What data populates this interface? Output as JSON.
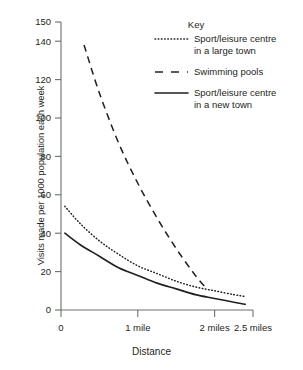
{
  "chart_data": {
    "type": "line",
    "title": "",
    "xlabel": "Distance",
    "ylabel": "Visits made per 1000 population each week",
    "xlim": [
      0,
      2.5
    ],
    "ylim": [
      0,
      150
    ],
    "grid": false,
    "legend_position": "top-right",
    "legend_title": "Key",
    "y_ticks": [
      0,
      20,
      40,
      60,
      80,
      100,
      120,
      140,
      150
    ],
    "y_tick_labels": [
      "0",
      "20",
      "40",
      "60",
      "80",
      "100",
      "120",
      "140",
      "150"
    ],
    "x_ticks": [
      0,
      1,
      2,
      2.5
    ],
    "x_tick_labels": [
      "0",
      "1 mile",
      "2 miles",
      "2.5 miles"
    ],
    "series": [
      {
        "name": "Sport/leisure centre in a large town",
        "style": "dotted",
        "color": "#231f20",
        "x": [
          0.05,
          0.25,
          0.5,
          0.75,
          1.0,
          1.25,
          1.5,
          1.75,
          2.0,
          2.25,
          2.4
        ],
        "values": [
          54,
          45,
          36,
          29,
          23,
          19,
          15,
          12,
          10,
          8,
          7
        ]
      },
      {
        "name": "Swimming pools",
        "style": "dashed",
        "color": "#231f20",
        "x": [
          0.3,
          0.5,
          0.75,
          1.0,
          1.25,
          1.5,
          1.75,
          1.9
        ],
        "values": [
          138,
          113,
          87,
          66,
          48,
          32,
          18,
          11
        ]
      },
      {
        "name": "Sport/leisure centre in a new town",
        "style": "solid",
        "color": "#231f20",
        "x": [
          0.05,
          0.25,
          0.5,
          0.75,
          1.0,
          1.25,
          1.5,
          1.75,
          2.0,
          2.25,
          2.4
        ],
        "values": [
          40,
          34,
          28,
          22,
          18,
          14,
          11,
          8,
          6,
          4,
          3
        ]
      }
    ]
  },
  "axes": {
    "y_title": "Visits made per 1000 population each week",
    "x_title": "Distance"
  },
  "legend": {
    "title": "Key",
    "entries": [
      {
        "label_line1": "Sport/leisure centre",
        "label_line2": "in a large town",
        "style": "dotted"
      },
      {
        "label_line1": "Swimming pools",
        "label_line2": "",
        "style": "dashed"
      },
      {
        "label_line1": "Sport/leisure centre",
        "label_line2": "in a new town",
        "style": "solid"
      }
    ]
  }
}
